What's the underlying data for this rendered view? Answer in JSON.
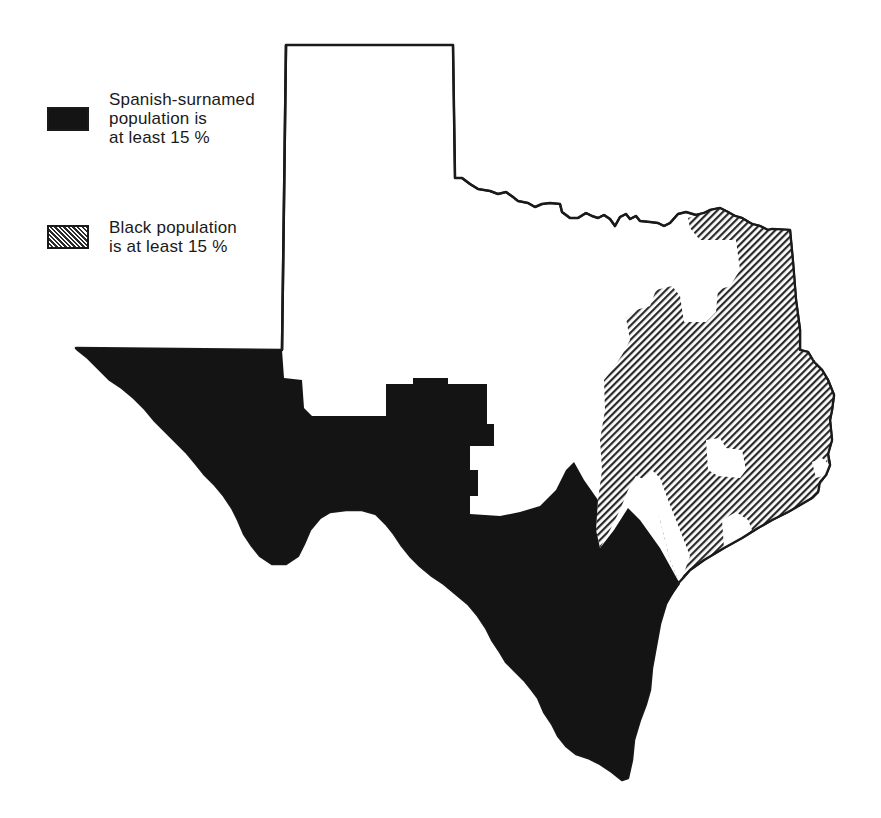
{
  "map": {
    "subject": "Texas",
    "background_color": "#ffffff",
    "outline_color": "#1a1a1a",
    "legend": [
      {
        "id": "spanish",
        "pattern": "solid-black",
        "color": "#141414",
        "lines": [
          "Spanish-surnamed",
          "population is",
          "at least 15 %"
        ]
      },
      {
        "id": "black",
        "pattern": "diagonal-hatch",
        "color": "#2a2a2a",
        "lines": [
          "Black population",
          "is at least 15 %"
        ]
      }
    ],
    "regions": [
      {
        "name": "Spanish-surnamed majority region",
        "location": "West and South Texas (Trans-Pecos, border, South Texas)",
        "category": "spanish"
      },
      {
        "name": "Black population region",
        "location": "East Texas",
        "category": "black"
      },
      {
        "name": "Other region",
        "location": "Panhandle and Central Texas",
        "category": "none"
      }
    ]
  }
}
